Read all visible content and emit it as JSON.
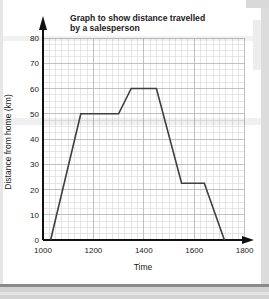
{
  "page": {
    "background": "#ffffff",
    "page_edge_color": "#d3d3d3"
  },
  "chart_data": {
    "type": "line",
    "title": "Graph to show distance travelled by a salesperson",
    "title_lines": [
      "Graph to show distance travelled",
      "by a salesperson"
    ],
    "xlabel": "Time",
    "ylabel": "Distance from home (km)",
    "xlim": [
      1000,
      1800
    ],
    "ylim": [
      0,
      80
    ],
    "x_ticks": [
      1000,
      1200,
      1400,
      1600,
      1800
    ],
    "y_ticks": [
      0,
      10,
      20,
      30,
      40,
      50,
      60,
      70,
      80
    ],
    "x_minor_step": 25,
    "y_minor_step": 2.5,
    "grid": "on",
    "legend": "none",
    "series": [
      {
        "name": "salesperson distance from home",
        "points": [
          [
            1030,
            0
          ],
          [
            1150,
            50
          ],
          [
            1300,
            50
          ],
          [
            1350,
            60
          ],
          [
            1450,
            60
          ],
          [
            1550,
            22.5
          ],
          [
            1640,
            22.5
          ],
          [
            1720,
            0
          ]
        ]
      }
    ],
    "colors": {
      "line": "#3f3f3f",
      "axis": "#111111",
      "grid_minor": "#dcdcdc",
      "grid_major": "#b2b2b2",
      "text": "#1a1a1a"
    }
  }
}
